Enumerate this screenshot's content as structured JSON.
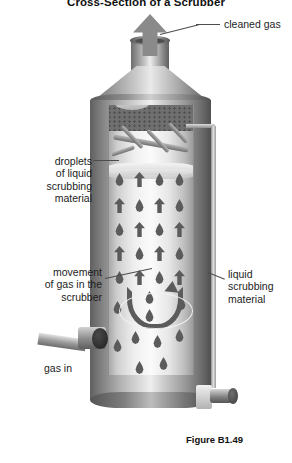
{
  "figure": {
    "title": "Cross-Section of a Scrubber",
    "caption": "Figure B1.49"
  },
  "labels": {
    "cleaned_gas": "cleaned gas",
    "droplets": "droplets\nof liquid\nscrubbing\nmaterial",
    "movement": "movement\nof gas in the\nscrubber",
    "liquid": "liquid\nscrubbing\nmaterial",
    "gas_in": "gas in"
  },
  "components": {
    "stack": "exhaust-stack",
    "cone": "reducer-cone",
    "shell": "vessel-shell",
    "demister": "demister-mesh-pad",
    "spray_header": "spray-header-pipes",
    "liquid_line": "liquid-supply-line",
    "inlet": "gas-inlet-nozzle",
    "drain_valve": "drain-valve",
    "gas_arrow": "cleaned-gas-arrow",
    "swirl": "gas-movement-arrow"
  },
  "colors": {
    "metal_light": "#eeeeee",
    "metal_mid": "#9a9a9a",
    "metal_dark": "#4f4f4f",
    "symbol": "#5b5b5b",
    "arrow": "#8a8a8a",
    "text": "#1d1d1d",
    "background": "#ffffff"
  },
  "counts": {
    "droplets": 22,
    "up_arrows": 11
  }
}
